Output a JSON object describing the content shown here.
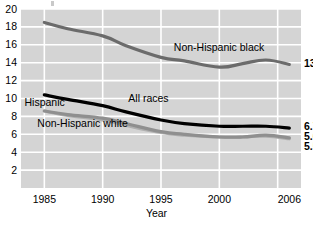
{
  "chart_data": {
    "type": "line",
    "title": "",
    "xlabel": "Year",
    "ylabel": "",
    "xlim": [
      1983,
      2007
    ],
    "ylim": [
      0,
      20
    ],
    "grid": true,
    "legend_position": "inline-annotations",
    "x_ticks": [
      "1985",
      "1990",
      "1995",
      "2000",
      "2006"
    ],
    "x_tick_values": [
      1985,
      1990,
      1995,
      2000,
      2006
    ],
    "y_ticks": [
      "20",
      "18",
      "16",
      "14",
      "12",
      "10",
      "8",
      "6",
      "4",
      "2"
    ],
    "y_tick_values": [
      20,
      18,
      16,
      14,
      12,
      10,
      8,
      6,
      4,
      2
    ],
    "series": [
      {
        "name": "Non-Hispanic black",
        "color": "#6b6b6b",
        "end_value": "13.8",
        "x": [
          1985,
          1987,
          1990,
          1992,
          1995,
          1997,
          2000,
          2002,
          2004,
          2006
        ],
        "values": [
          18.5,
          17.8,
          17.0,
          15.9,
          14.6,
          14.2,
          13.5,
          13.9,
          14.3,
          13.8
        ]
      },
      {
        "name": "All races",
        "color": "#000000",
        "end_value": "6.7",
        "x": [
          1985,
          1987,
          1990,
          1992,
          1995,
          1997,
          2000,
          2002,
          2004,
          2006
        ],
        "values": [
          10.4,
          9.9,
          9.2,
          8.5,
          7.6,
          7.2,
          6.9,
          6.9,
          6.9,
          6.7
        ]
      },
      {
        "name": "Hispanic",
        "color": "#8f8f8f",
        "end_value": "5.6",
        "x": [
          1985,
          1987,
          1990,
          1992,
          1995,
          1997,
          2000,
          2002,
          2004,
          2006
        ],
        "values": [
          8.6,
          8.2,
          7.8,
          7.2,
          6.3,
          6.0,
          5.7,
          5.7,
          5.9,
          5.6
        ]
      },
      {
        "name": "Non-Hispanic white",
        "color": "#b0b0b0",
        "end_value": "5.5",
        "x": [
          1985,
          1987,
          1990,
          1992,
          1995,
          1997,
          2000,
          2002,
          2004,
          2006
        ],
        "values": [
          8.6,
          8.1,
          7.6,
          7.0,
          6.2,
          5.9,
          5.7,
          5.7,
          5.8,
          5.5
        ]
      }
    ],
    "annotations": [
      {
        "text": "Non-Hispanic black",
        "x": 1996.1,
        "y": 15.6
      },
      {
        "text": "All races",
        "x": 1992.2,
        "y": 10.0
      },
      {
        "text": "Hispanic",
        "x": 1983.3,
        "y": 9.55
      },
      {
        "text": "Non-Hispanic white",
        "x": 1984.4,
        "y": 7.15
      }
    ]
  },
  "colors": {
    "plot_background": "#d4d4d4",
    "grid": "#ffffff",
    "page_background": "#ffffff",
    "text": "#000000"
  }
}
